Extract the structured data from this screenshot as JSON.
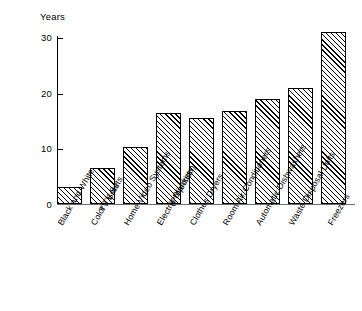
{
  "chart_data": {
    "type": "bar",
    "title": "",
    "subtitle": "",
    "xlabel": "",
    "ylabel": "Years",
    "ylim": [
      0,
      33
    ],
    "grid": false,
    "legend": null,
    "y_ticks": [
      0,
      10,
      20,
      30
    ],
    "y_tick_labels": [
      "0",
      "10",
      "20",
      "30"
    ],
    "categories": [
      "Black and White\nTV Sets",
      "Color TV Sets",
      "Home Video Systems\n(Projection)",
      "Electric Blankets",
      "Clothes Dryers",
      "Room Air Conditioners",
      "Automatic Dishwashers",
      "Waste Disposal Units",
      "Freezers"
    ],
    "values": [
      3.0,
      6.5,
      10.3,
      16.5,
      15.5,
      16.8,
      18.9,
      21.0,
      31.0
    ],
    "bar_style": {
      "fill": "diagonal-hatch",
      "hatch_color": "#000000",
      "background": "#ffffff",
      "edge_color": "#000000"
    }
  },
  "axis": {
    "y_label": "Years",
    "ticks": [
      {
        "label": "30",
        "value": 30
      },
      {
        "label": "20",
        "value": 20
      },
      {
        "label": "10",
        "value": 10
      },
      {
        "label": "0",
        "value": 0
      }
    ]
  },
  "x_labels": [
    {
      "line1": "Black and White",
      "line2": "TV Sets"
    },
    {
      "line1": "Color TV Sets",
      "line2": ""
    },
    {
      "line1": "Home Video Systems",
      "line2": "(Projection)"
    },
    {
      "line1": "Electric Blankets",
      "line2": ""
    },
    {
      "line1": "Clothes Dryers",
      "line2": ""
    },
    {
      "line1": "Room Air Conditioners",
      "line2": ""
    },
    {
      "line1": "Automatic Dishwashers",
      "line2": ""
    },
    {
      "line1": "Waste Disposal Units",
      "line2": ""
    },
    {
      "line1": "Freezers",
      "line2": ""
    }
  ]
}
